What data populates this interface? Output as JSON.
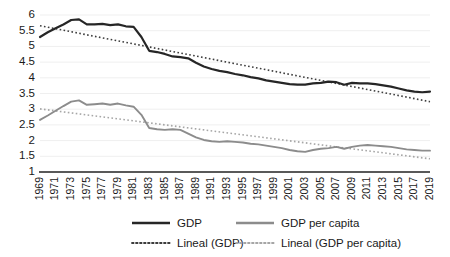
{
  "chart_data": {
    "type": "line",
    "title": "",
    "xlabel": "",
    "ylabel": "",
    "ylim": [
      1,
      6
    ],
    "ytick_values": [
      1,
      1.5,
      2,
      2.5,
      3,
      3.5,
      4,
      4.5,
      5,
      5.5,
      6
    ],
    "ytick_labels": [
      "1",
      "1.5",
      "2",
      "2.5",
      "3",
      "3.5",
      "4",
      "4.5",
      "5",
      "5.5",
      "6"
    ],
    "grid": true,
    "grid_axis": "y",
    "legend_position": "bottom",
    "x": [
      1969,
      1970,
      1971,
      1972,
      1973,
      1974,
      1975,
      1976,
      1977,
      1978,
      1979,
      1980,
      1981,
      1982,
      1983,
      1984,
      1985,
      1986,
      1987,
      1988,
      1989,
      1990,
      1991,
      1992,
      1993,
      1994,
      1995,
      1996,
      1997,
      1998,
      1999,
      2000,
      2001,
      2002,
      2003,
      2004,
      2005,
      2006,
      2007,
      2008,
      2009,
      2010,
      2011,
      2012,
      2013,
      2014,
      2015,
      2016,
      2017,
      2018,
      2019
    ],
    "xtick_labels": [
      "1969",
      "1971",
      "1973",
      "1975",
      "1977",
      "1979",
      "1981",
      "1983",
      "1985",
      "1987",
      "1989",
      "1991",
      "1993",
      "1995",
      "1997",
      "1999",
      "2001",
      "2003",
      "2005",
      "2007",
      "2009",
      "2011",
      "2013",
      "2015",
      "2017",
      "2019"
    ],
    "series": [
      {
        "name": "GDP",
        "style": "solid",
        "color": "#262626",
        "values": [
          5.3,
          5.45,
          5.58,
          5.7,
          5.84,
          5.86,
          5.7,
          5.7,
          5.72,
          5.68,
          5.7,
          5.64,
          5.62,
          5.3,
          4.86,
          4.82,
          4.76,
          4.68,
          4.66,
          4.62,
          4.48,
          4.36,
          4.28,
          4.22,
          4.18,
          4.12,
          4.08,
          4.02,
          3.98,
          3.92,
          3.88,
          3.84,
          3.8,
          3.78,
          3.78,
          3.82,
          3.84,
          3.88,
          3.86,
          3.78,
          3.84,
          3.82,
          3.82,
          3.8,
          3.76,
          3.72,
          3.66,
          3.6,
          3.56,
          3.54,
          3.56
        ]
      },
      {
        "name": "GDP per capita",
        "style": "solid",
        "color": "#8c8c8c",
        "values": [
          2.66,
          2.8,
          2.95,
          3.1,
          3.24,
          3.28,
          3.14,
          3.16,
          3.18,
          3.14,
          3.18,
          3.12,
          3.08,
          2.82,
          2.4,
          2.36,
          2.34,
          2.36,
          2.34,
          2.22,
          2.1,
          2.02,
          1.98,
          1.96,
          1.98,
          1.96,
          1.94,
          1.9,
          1.88,
          1.84,
          1.8,
          1.76,
          1.7,
          1.66,
          1.64,
          1.7,
          1.74,
          1.76,
          1.8,
          1.74,
          1.8,
          1.84,
          1.86,
          1.84,
          1.82,
          1.8,
          1.76,
          1.72,
          1.7,
          1.68,
          1.68
        ]
      }
    ],
    "trendlines": [
      {
        "name": "Lineal (GDP)",
        "style": "dotted",
        "color": "#3d3d3d",
        "of_series": "GDP",
        "start_value": 5.66,
        "end_value": 3.24
      },
      {
        "name": "Lineal (GDP per capita)",
        "style": "dotted",
        "color": "#a6a6a6",
        "of_series": "GDP per capita",
        "start_value": 3.01,
        "end_value": 1.42
      }
    ],
    "legend": [
      {
        "label": "GDP",
        "color": "#262626",
        "style": "solid"
      },
      {
        "label": "GDP per capita",
        "color": "#8c8c8c",
        "style": "solid"
      },
      {
        "label": "Lineal (GDP)",
        "color": "#3d3d3d",
        "style": "dotted"
      },
      {
        "label": "Lineal (GDP per capita)",
        "color": "#a6a6a6",
        "style": "dotted"
      }
    ]
  }
}
